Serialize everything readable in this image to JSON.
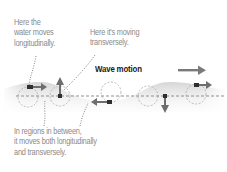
{
  "diagram": {
    "title": "Wave motion",
    "annotations": {
      "longitudinal": {
        "lines": [
          "Here the",
          "water moves",
          "longitudinally."
        ]
      },
      "transverse": {
        "lines": [
          "Here it's moving",
          "transversely."
        ]
      },
      "between": {
        "lines": [
          "In regions in between,",
          "it moves both longitudinally",
          "and transversely."
        ]
      }
    },
    "particles": [
      {
        "id": "p1",
        "motion": "longitudinal-right",
        "position": "crest"
      },
      {
        "id": "p2",
        "motion": "transverse-up",
        "position": "mid-rising"
      },
      {
        "id": "p3",
        "motion": "mixed",
        "position": "between"
      },
      {
        "id": "p4",
        "motion": "longitudinal-left",
        "position": "trough"
      },
      {
        "id": "p5",
        "motion": "transverse-down",
        "position": "mid-falling"
      },
      {
        "id": "p6",
        "motion": "longitudinal-right",
        "position": "crest"
      }
    ],
    "colors": {
      "water": "#e3e3e3",
      "arrow": "#6e6e6e",
      "particle": "#2f2f2f",
      "dashed": "#8f8f8f",
      "text_muted": "#8a8a8a",
      "text_title": "#1a1a1a"
    }
  }
}
